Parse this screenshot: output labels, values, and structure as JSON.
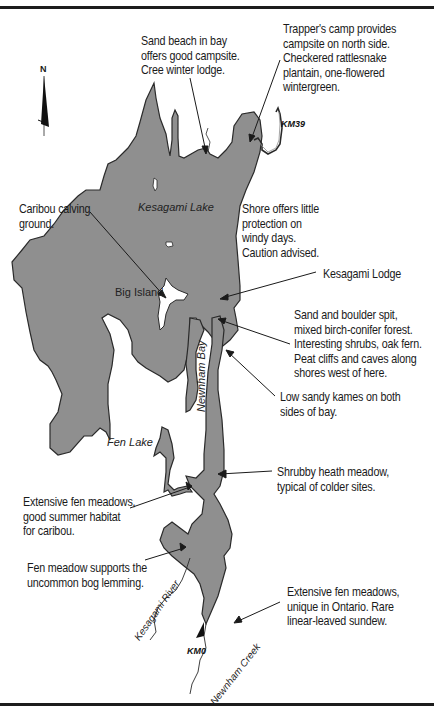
{
  "map": {
    "title": "Kesagami Lake and Newnham Bay route map",
    "colors": {
      "water": "#8f8f8f",
      "shoreline": "#2a2a2a",
      "background": "#ffffff",
      "rule": "#1c1c1c"
    },
    "north_arrow": {
      "label": "N"
    },
    "place_labels": {
      "kesagami_lake": "Kesagami Lake",
      "big_island": "Big Island",
      "fen_lake": "Fen Lake",
      "newnham_bay": "Newnham Bay",
      "kesagami_river": "Kesagami River",
      "newnham_creek": "Newnham Creek"
    },
    "km_markers": {
      "km39": "KM39",
      "km0": "KM0"
    },
    "annotations": [
      {
        "id": "sand-beach",
        "text": "Sand beach in bay\noffers good campsite.\nCree winter lodge."
      },
      {
        "id": "trappers-camp",
        "text": "Trapper's camp provides\ncampsite on north side.\nCheckered rattlesnake\nplantain, one-flowered\nwintergreen."
      },
      {
        "id": "caribou-calving",
        "text": "Caribou calving\nground."
      },
      {
        "id": "shore-caution",
        "text": "Shore offers little\nprotection on\nwindy days.\nCaution advised."
      },
      {
        "id": "kesagami-lodge",
        "text": "Kesagami Lodge"
      },
      {
        "id": "sand-boulder-spit",
        "text": "Sand and boulder spit,\nmixed birch-conifer forest.\nInteresting shrubs, oak fern.\nPeat cliffs and caves along\nshores west of here."
      },
      {
        "id": "sandy-kames",
        "text": "Low sandy kames on both\nsides of bay."
      },
      {
        "id": "shrubby-heath",
        "text": "Shrubby heath meadow,\ntypical of colder sites."
      },
      {
        "id": "fen-meadows-caribou",
        "text": "Extensive fen meadows,\ngood summer habitat\nfor caribou."
      },
      {
        "id": "bog-lemming",
        "text": "Fen meadow supports the\nuncommon bog lemming."
      },
      {
        "id": "fen-meadows-ontario",
        "text": "Extensive fen meadows,\nunique in Ontario. Rare\nlinear-leaved sundew."
      }
    ]
  }
}
